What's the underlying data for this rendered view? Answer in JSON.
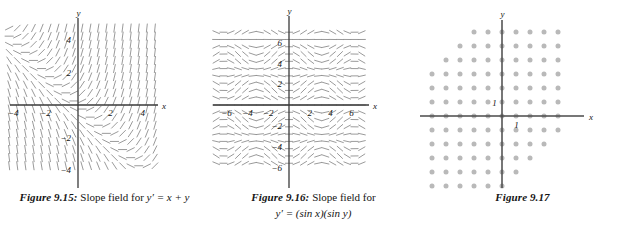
{
  "page": {
    "background": "#ffffff",
    "ink": "#1a1a1a",
    "figure_count": 3
  },
  "figures": [
    {
      "id": "figure-9-15",
      "caption_number": "Figure 9.15:",
      "caption_text": "Slope field for",
      "caption_equation": "y′ = x + y",
      "axis_x_label": "x",
      "axis_y_label": "y",
      "x_ticks": [
        "−4",
        "−2",
        "2",
        "4"
      ],
      "y_ticks": [
        "4",
        "2",
        "−2",
        "−4"
      ],
      "glyph_color": "#8f8f8f",
      "axis_color": "#3a3a3a"
    },
    {
      "id": "figure-9-16",
      "caption_number": "Figure 9.16:",
      "caption_text": "Slope field for",
      "caption_equation": "y′ = (sin x)(sin y)",
      "axis_x_label": "x",
      "axis_y_label": "y",
      "x_ticks": [
        "−6",
        "−4",
        "−2",
        "2",
        "4",
        "6"
      ],
      "y_ticks": [
        "6",
        "4",
        "2",
        "−2",
        "−4",
        "−6"
      ],
      "glyph_color": "#8f8f8f",
      "axis_color": "#3a3a3a"
    },
    {
      "id": "figure-9-17",
      "caption_number": "Figure 9.17",
      "caption_text": "",
      "caption_equation": "",
      "axis_x_label": "x",
      "axis_y_label": "y",
      "x_ticks": [
        "1"
      ],
      "y_ticks": [
        "1"
      ],
      "dot_color": "#b9b9b9",
      "axis_color": "#4a4a4a"
    }
  ],
  "chart_data": [
    {
      "type": "slope-field",
      "title": "Figure 9.15: Slope field for y' = x + y",
      "equation": "y' = x + y",
      "xlabel": "x",
      "ylabel": "y",
      "xlim": [
        -5,
        5
      ],
      "ylim": [
        -5,
        5
      ],
      "xticks": [
        -4,
        -2,
        2,
        4
      ],
      "yticks": [
        -4,
        -2,
        2,
        4
      ],
      "grid": false,
      "legend": "none",
      "sample_step": 0.5,
      "slope_formula": "x + y",
      "note": "Dashes tangent to slope x+y; nullcline y = -x runs diagonally; field is steep/vertical far from the line y = -x."
    },
    {
      "type": "slope-field",
      "title": "Figure 9.16: Slope field for y' = (sin x)(sin y)",
      "equation": "y' = (sin x)(sin y)",
      "xlabel": "x",
      "ylabel": "y",
      "xlim": [
        -7.5,
        7.5
      ],
      "ylim": [
        -7.5,
        7.5
      ],
      "xticks": [
        -6,
        -4,
        -2,
        2,
        4,
        6
      ],
      "yticks": [
        -6,
        -4,
        -2,
        2,
        4,
        6
      ],
      "grid": false,
      "legend": "none",
      "sample_step": 0.7,
      "slope_formula": "sin(x)*sin(y)",
      "note": "Horizontal dashes along the lines x = kπ and y = kπ; periodic cellular pattern."
    },
    {
      "type": "scatter",
      "title": "Figure 9.17",
      "xlabel": "x",
      "ylabel": "y",
      "xlim": [
        -6.5,
        5.5
      ],
      "ylim": [
        -5.5,
        6.5
      ],
      "xticks": [
        1
      ],
      "yticks": [
        1
      ],
      "grid": false,
      "legend": "none",
      "marker": "filled-circle",
      "spacing": 1,
      "description": "Lattice of gray dots filling a staircase region bounded above-right/below-left by a diagonal; dots occupy integer lattice points where x + y is at most about 5 and at least about -5.",
      "lattice_rows": [
        {
          "y": 6,
          "x_from": -2,
          "x_to": 4
        },
        {
          "y": 5,
          "x_from": -3,
          "x_to": 4
        },
        {
          "y": 4,
          "x_from": -4,
          "x_to": 4
        },
        {
          "y": 3,
          "x_from": -5,
          "x_to": 4
        },
        {
          "y": 2,
          "x_from": -6,
          "x_to": 4
        },
        {
          "y": 1,
          "x_from": -6,
          "x_to": 4
        },
        {
          "y": 0,
          "x_from": -6,
          "x_to": 4
        },
        {
          "y": -1,
          "x_from": -6,
          "x_to": 4
        },
        {
          "y": -2,
          "x_from": -6,
          "x_to": 3
        },
        {
          "y": -3,
          "x_from": -6,
          "x_to": 2
        },
        {
          "y": -4,
          "x_from": -6,
          "x_to": 1
        },
        {
          "y": -5,
          "x_from": -6,
          "x_to": 0
        }
      ]
    }
  ]
}
